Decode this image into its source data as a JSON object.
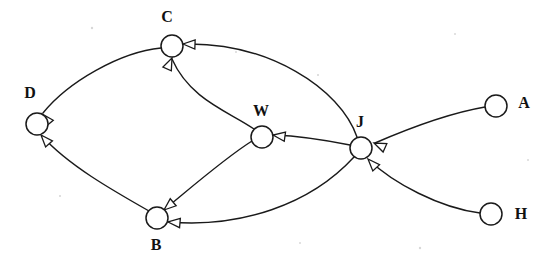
{
  "diagram": {
    "background_color": "#ffffff",
    "stroke_color": "#1a1a1a",
    "node_radius": 11,
    "nodes": [
      {
        "id": "C",
        "label": "C",
        "cx": 172,
        "cy": 46,
        "label_x": 167,
        "label_y": 18
      },
      {
        "id": "D",
        "label": "D",
        "cx": 37,
        "cy": 124,
        "label_x": 30,
        "label_y": 94
      },
      {
        "id": "W",
        "label": "W",
        "cx": 262,
        "cy": 137,
        "label_x": 261,
        "label_y": 112
      },
      {
        "id": "J",
        "label": "J",
        "cx": 361,
        "cy": 148,
        "label_x": 360,
        "label_y": 123
      },
      {
        "id": "A",
        "label": "A",
        "cx": 496,
        "cy": 106,
        "label_x": 524,
        "label_y": 104
      },
      {
        "id": "B",
        "label": "B",
        "cx": 157,
        "cy": 218,
        "label_x": 156,
        "label_y": 246
      },
      {
        "id": "H",
        "label": "H",
        "cx": 491,
        "cy": 214,
        "label_x": 521,
        "label_y": 215
      }
    ],
    "edges": [
      {
        "id": "A-J",
        "from": "A",
        "to": "J",
        "directed": true,
        "path": "M 485 107 C 450 113 405 130 375 143",
        "arrow_x": 374,
        "arrow_y": 143,
        "arrow_angle": 204
      },
      {
        "id": "H-J",
        "from": "H",
        "to": "J",
        "directed": true,
        "path": "M 480 213 C 440 208 393 183 369 160",
        "arrow_x": 368,
        "arrow_y": 159,
        "arrow_angle": 227
      },
      {
        "id": "J-C",
        "from": "J",
        "to": "C",
        "directed": true,
        "path": "M 357 137 C 340 88 268 42 184 44",
        "arrow_x": 183,
        "arrow_y": 44,
        "arrow_angle": 182
      },
      {
        "id": "J-W",
        "from": "J",
        "to": "W",
        "directed": true,
        "path": "M 350 145 C 330 141 300 136 274 135",
        "arrow_x": 273,
        "arrow_y": 135,
        "arrow_angle": 188
      },
      {
        "id": "J-B",
        "from": "J",
        "to": "B",
        "directed": true,
        "path": "M 354 157 C 310 205 240 228 169 222",
        "arrow_x": 168,
        "arrow_y": 222,
        "arrow_angle": 185
      },
      {
        "id": "W-C",
        "from": "W",
        "to": "C",
        "directed": true,
        "path": "M 254 129 C 230 112 190 100 172 59",
        "arrow_x": 172,
        "arrow_y": 58,
        "arrow_angle": 294
      },
      {
        "id": "W-B",
        "from": "W",
        "to": "B",
        "directed": true,
        "path": "M 252 141 C 225 158 193 186 165 209",
        "arrow_x": 164,
        "arrow_y": 210,
        "arrow_angle": 140
      },
      {
        "id": "C-D",
        "from": "C",
        "to": "D",
        "directed": true,
        "path": "M 161 48 C 120 52 68 82 43 113",
        "arrow_x": 42,
        "arrow_y": 114,
        "arrow_angle": 230
      },
      {
        "id": "B-D",
        "from": "B",
        "to": "D",
        "directed": true,
        "path": "M 149 211 C 112 190 68 165 42 136",
        "arrow_x": 41,
        "arrow_y": 135,
        "arrow_angle": 228
      }
    ]
  }
}
